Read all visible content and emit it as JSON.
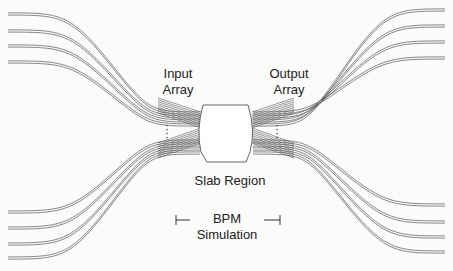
{
  "diagram": {
    "labels": {
      "input_array": [
        "Input",
        "Array"
      ],
      "output_array": [
        "Output",
        "Array"
      ],
      "slab_region": "Slab Region",
      "bpm_simulation": [
        "BPM",
        "Simulation"
      ]
    },
    "colors": {
      "line": "#555555",
      "background": "#fbfbfa",
      "text": "#222222"
    },
    "waveguide_groups": [
      {
        "name": "input-upper",
        "count": 4
      },
      {
        "name": "input-lower",
        "count": 4
      },
      {
        "name": "output-upper",
        "count": 4
      },
      {
        "name": "output-lower",
        "count": 4
      }
    ],
    "ellipsis": "⋮"
  }
}
